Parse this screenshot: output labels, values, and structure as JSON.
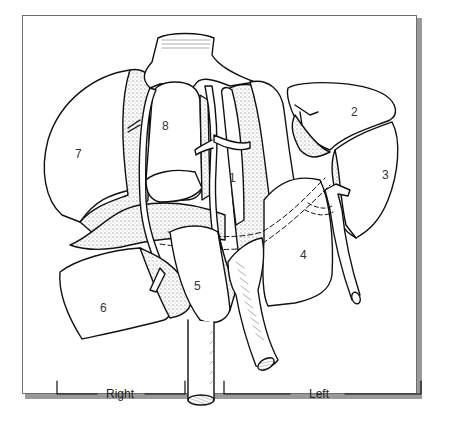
{
  "figure": {
    "segments": [
      {
        "id": "1",
        "label": "1"
      },
      {
        "id": "2",
        "label": "2"
      },
      {
        "id": "3",
        "label": "3"
      },
      {
        "id": "4",
        "label": "4"
      },
      {
        "id": "5",
        "label": "5"
      },
      {
        "id": "6",
        "label": "6"
      },
      {
        "id": "7",
        "label": "7"
      },
      {
        "id": "8",
        "label": "8"
      }
    ],
    "sides": {
      "right": "Right",
      "left": "Left"
    },
    "colors": {
      "outline": "#111111",
      "stipple": "#b5b5b5",
      "frame_border": "#6f6f6f",
      "frame_shadow": "#9a9a9a"
    }
  }
}
